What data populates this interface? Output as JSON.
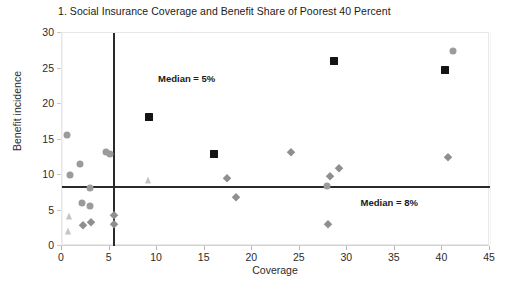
{
  "chart_data": {
    "type": "scatter",
    "title": "1. Social Insurance Coverage and Benefit Share of Poorest 40 Percent",
    "xlabel": "Coverage",
    "ylabel": "Benefit incidence",
    "xlim": [
      0,
      45
    ],
    "ylim": [
      0,
      30
    ],
    "xticks": [
      0,
      5,
      10,
      15,
      20,
      25,
      30,
      35,
      40,
      45
    ],
    "yticks": [
      0,
      5,
      10,
      15,
      20,
      25,
      30
    ],
    "grid": false,
    "legend": "none",
    "annotations": [
      {
        "name": "median-coverage",
        "text": "Median = 5%",
        "orientation": "vertical",
        "value": 5.4,
        "label_x": 10.2,
        "label_y": 24.2
      },
      {
        "name": "median-benefit-incidence",
        "text": "Median = 8%",
        "orientation": "horizontal",
        "value": 8.4,
        "label_x": 31.5,
        "label_y": 6.7
      }
    ],
    "series": [
      {
        "name": "circle-series",
        "marker": "circle",
        "color": "#9b9b9b",
        "size": 7,
        "points": [
          {
            "x": 0.5,
            "y": 15.6
          },
          {
            "x": 0.8,
            "y": 10.0
          },
          {
            "x": 1.9,
            "y": 11.6
          },
          {
            "x": 2.9,
            "y": 8.1
          },
          {
            "x": 2.1,
            "y": 6.1
          },
          {
            "x": 2.9,
            "y": 5.7
          },
          {
            "x": 4.6,
            "y": 13.2
          },
          {
            "x": 5.0,
            "y": 12.9
          },
          {
            "x": 27.9,
            "y": 8.4
          },
          {
            "x": 41.1,
            "y": 27.5
          }
        ]
      },
      {
        "name": "square-series",
        "marker": "square",
        "color": "#141414",
        "size": 8,
        "points": [
          {
            "x": 9.1,
            "y": 18.1
          },
          {
            "x": 16.0,
            "y": 12.9
          },
          {
            "x": 28.6,
            "y": 26.0
          },
          {
            "x": 40.3,
            "y": 24.8
          }
        ]
      },
      {
        "name": "diamond-series",
        "marker": "diamond",
        "color": "#8f8f8f",
        "size": 5.5,
        "points": [
          {
            "x": 2.2,
            "y": 2.9
          },
          {
            "x": 3.0,
            "y": 3.4
          },
          {
            "x": 5.5,
            "y": 4.4
          },
          {
            "x": 5.5,
            "y": 3.1
          },
          {
            "x": 17.4,
            "y": 9.6
          },
          {
            "x": 18.3,
            "y": 6.9
          },
          {
            "x": 24.1,
            "y": 13.2
          },
          {
            "x": 28.0,
            "y": 3.1
          },
          {
            "x": 28.2,
            "y": 9.8
          },
          {
            "x": 29.1,
            "y": 11.0
          },
          {
            "x": 40.6,
            "y": 12.5
          }
        ]
      },
      {
        "name": "triangle-series",
        "marker": "triangle",
        "color": "#c4c4c4",
        "size": 7,
        "points": [
          {
            "x": 0.7,
            "y": 4.2
          },
          {
            "x": 0.6,
            "y": 2.1
          },
          {
            "x": 9.0,
            "y": 9.3
          }
        ]
      }
    ]
  }
}
